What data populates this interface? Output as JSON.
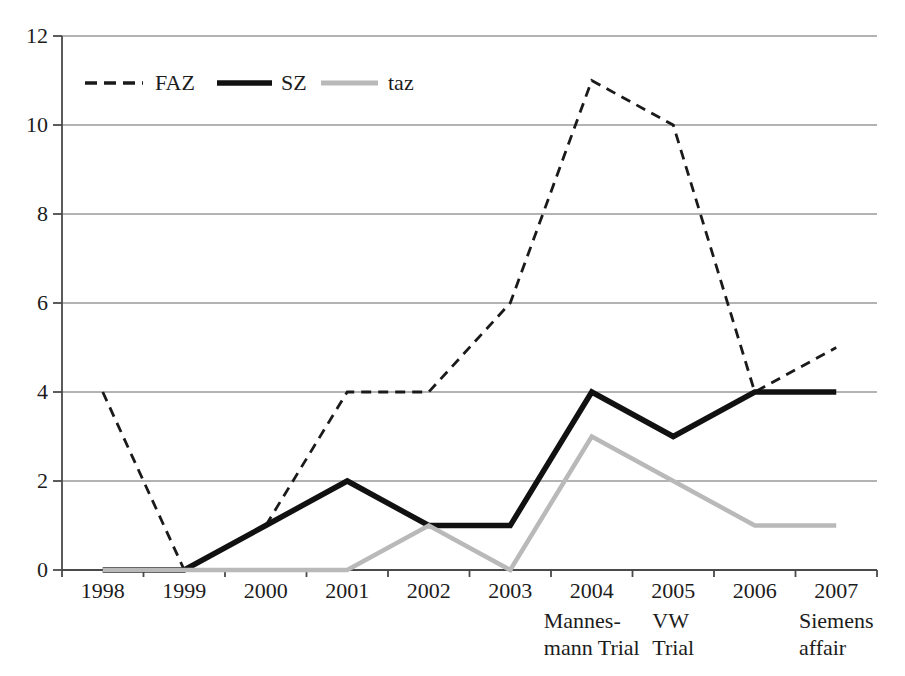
{
  "colors": {
    "background": "#ffffff",
    "text": "#1c1c1c",
    "grid": "#9a9a9a",
    "axis": "#4a4a4a"
  },
  "chart_data": {
    "type": "line",
    "categories": [
      "1998",
      "1999",
      "2000",
      "2001",
      "2002",
      "2003",
      "2004",
      "2005",
      "2006",
      "2007"
    ],
    "yticks": [
      0,
      2,
      4,
      6,
      8,
      10,
      12
    ],
    "ylim": [
      0,
      12
    ],
    "grid": "horizontal",
    "series": [
      {
        "name": "FAZ",
        "line_style": "dashed",
        "color": "#1a1a1a",
        "values": [
          4,
          0,
          1,
          4,
          4,
          6,
          11,
          10,
          4,
          5
        ]
      },
      {
        "name": "SZ",
        "line_style": "solid",
        "color": "#111111",
        "values": [
          0,
          0,
          1,
          2,
          1,
          1,
          4,
          3,
          4,
          4
        ]
      },
      {
        "name": "taz",
        "line_style": "solid",
        "color": "#b9b9b9",
        "values": [
          0,
          0,
          0,
          0,
          1,
          0,
          3,
          2,
          1,
          1
        ]
      }
    ],
    "annotations": [
      {
        "category": "2004",
        "text": "Mannes-\nmann Trial"
      },
      {
        "category": "2005",
        "text": "VW\nTrial"
      },
      {
        "category": "2007",
        "text": "Siemens\naffair"
      }
    ],
    "legend": {
      "position": "top-left",
      "entries": [
        "FAZ",
        "SZ",
        "taz"
      ]
    }
  }
}
